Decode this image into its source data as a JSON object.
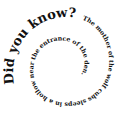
{
  "spiral_text": {
    "heading": "Did you know?",
    "body": "The mother of the wolf cubs sleeps in a hollow near the entrance of the den."
  },
  "colors": {
    "text": "#111111",
    "background": "#ffffff"
  }
}
